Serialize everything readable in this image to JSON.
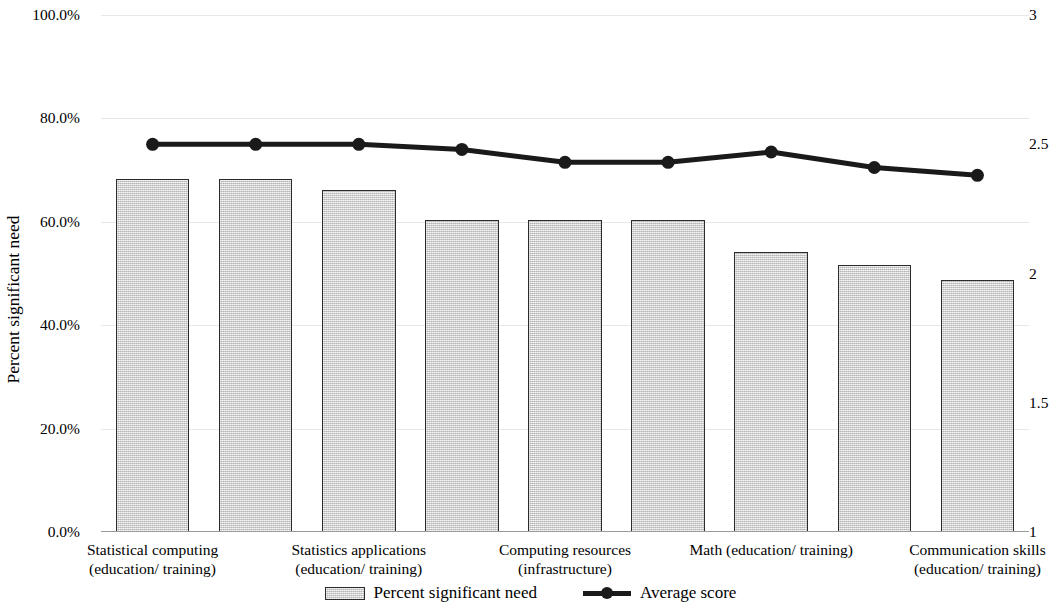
{
  "chart_data": {
    "type": "bar",
    "title": "",
    "subtitle": "",
    "xlabel": "",
    "ylabel": "Percent significant need",
    "y2label": "",
    "grid": true,
    "legend_position": "bottom",
    "categories": [
      "Statistical computing (education/ training)",
      "Statistics applications (education/ training)",
      "Data management (education/ training)",
      "Statistical software (infrastructure)",
      "Computing resources (infrastructure)",
      "Study design (education/ training)",
      "Bioinformatics (education/ training)",
      "Math (education/ training)",
      "Communication skills (education/ training)"
    ],
    "category_labels_shown": [
      {
        "line1": "Statistical computing",
        "line2": "(education/ training)"
      },
      {
        "line1": "Statistics applications",
        "line2": "(education/ training)"
      },
      {
        "line1": "Computing resources",
        "line2": "(infrastructure)"
      },
      {
        "line1": "Math (education/ training)",
        "line2": ""
      },
      {
        "line1": "Communication skills",
        "line2": "(education/ training)"
      }
    ],
    "series": [
      {
        "name": "Percent significant need",
        "axis": "left",
        "type": "bar",
        "values": [
          68.3,
          68.3,
          66.2,
          60.3,
          60.3,
          60.3,
          54.2,
          51.6,
          48.7
        ]
      },
      {
        "name": "Average score",
        "axis": "right",
        "type": "line",
        "values": [
          2.5,
          2.5,
          2.5,
          2.48,
          2.43,
          2.43,
          2.47,
          2.41,
          2.38
        ]
      }
    ],
    "left_axis": {
      "ticks": [
        "0.0%",
        "20.0%",
        "40.0%",
        "60.0%",
        "80.0%",
        "100.0%"
      ],
      "tick_values": [
        0,
        20,
        40,
        60,
        80,
        100
      ],
      "ylim": [
        0,
        100
      ]
    },
    "right_axis": {
      "ticks": [
        "1",
        "1.5",
        "2",
        "2.5",
        "3"
      ],
      "tick_values": [
        1,
        1.5,
        2,
        2.5,
        3
      ],
      "ylim": [
        1,
        3
      ]
    },
    "legend": [
      {
        "label": "Percent significant need",
        "marker": "bar-swatch"
      },
      {
        "label": "Average score",
        "marker": "line-marker"
      }
    ],
    "colors": {
      "bar_fill": "#d2d2d2",
      "bar_stroke": "#2b2b2b",
      "line": "#1a1a1a",
      "gridline": "#e8e8e8",
      "text": "#000000"
    }
  }
}
